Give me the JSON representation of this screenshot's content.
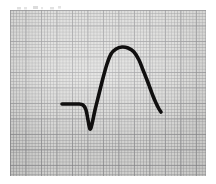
{
  "figure": {
    "media": "photocopied electrocardiogram strip",
    "background_color": "#ffffff",
    "paper_color": "#d9d9d7",
    "trace_color": "#100f0f",
    "grid": {
      "small_box_px": 3.1,
      "large_box_px": 15.5,
      "small_line_color": "#949496",
      "large_line_color": "#78787c",
      "visible": true
    },
    "paper_bounds_px": {
      "x": 10,
      "y": 10,
      "width": 196,
      "height": 166
    }
  },
  "annotations": {
    "scan_marks": "faint illegible gray marks along top edge of crop"
  },
  "chart_data": {
    "type": "line",
    "subtitle": "Single beat: flat baseline, deep narrow Q wave, tall broad R wave with rounded dome, descent to elevated terminal tail",
    "xlabel": "Time",
    "ylabel": "Amplitude",
    "grid": true,
    "legend_position": "none",
    "xlim": [
      0,
      216
    ],
    "ylim": [
      184,
      0
    ],
    "axis_units": "pixels (image coordinates, y inverted)",
    "series": [
      {
        "name": "ECG trace",
        "color": "#100f0f",
        "line_width_px": 3.6,
        "x": [
          62,
          70,
          78,
          83,
          86,
          88,
          90,
          92,
          95,
          99,
          103,
          107,
          111,
          116,
          122,
          128,
          134,
          139,
          143,
          147,
          150,
          153,
          156,
          159,
          161
        ],
        "y": [
          104,
          104,
          104,
          105,
          110,
          120,
          129,
          124,
          110,
          94,
          78,
          64,
          54,
          49,
          47,
          48,
          52,
          60,
          70,
          80,
          88,
          96,
          103,
          109,
          112
        ]
      }
    ],
    "features": [
      {
        "name": "baseline-start",
        "x": 62,
        "y": 104,
        "label": "isoelectric baseline onset"
      },
      {
        "name": "baseline-end",
        "x": 83,
        "y": 105,
        "label": "baseline end / Q onset"
      },
      {
        "name": "q-wave-trough",
        "x": 90,
        "y": 129,
        "label": "Q wave nadir"
      },
      {
        "name": "r-wave-apex",
        "x": 124,
        "y": 47,
        "label": "R wave / dome apex"
      },
      {
        "name": "dome-left",
        "x": 111,
        "y": 54,
        "label": "dome left shoulder"
      },
      {
        "name": "dome-right",
        "x": 139,
        "y": 60,
        "label": "dome right shoulder"
      },
      {
        "name": "trace-end",
        "x": 161,
        "y": 112,
        "label": "terminal tail end"
      }
    ]
  }
}
